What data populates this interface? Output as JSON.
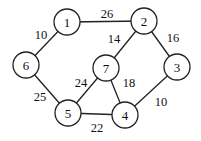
{
  "graph": {
    "type": "weighted-undirected-graph",
    "nodes": [
      {
        "id": "1",
        "label": "1",
        "x": 67,
        "y": 22
      },
      {
        "id": "2",
        "label": "2",
        "x": 144,
        "y": 21
      },
      {
        "id": "3",
        "label": "3",
        "x": 177,
        "y": 67
      },
      {
        "id": "4",
        "label": "4",
        "x": 125,
        "y": 115
      },
      {
        "id": "5",
        "label": "5",
        "x": 68,
        "y": 113
      },
      {
        "id": "6",
        "label": "6",
        "x": 26,
        "y": 65
      },
      {
        "id": "7",
        "label": "7",
        "x": 106,
        "y": 68
      }
    ],
    "edges": [
      {
        "from": "1",
        "to": "2",
        "weight": "26",
        "lx": 107,
        "ly": 14
      },
      {
        "from": "1",
        "to": "6",
        "weight": "10",
        "lx": 41,
        "ly": 35
      },
      {
        "from": "2",
        "to": "7",
        "weight": "14",
        "lx": 114,
        "ly": 39
      },
      {
        "from": "2",
        "to": "3",
        "weight": "16",
        "lx": 173,
        "ly": 38
      },
      {
        "from": "6",
        "to": "5",
        "weight": "25",
        "lx": 40,
        "ly": 97
      },
      {
        "from": "7",
        "to": "5",
        "weight": "24",
        "lx": 81,
        "ly": 83
      },
      {
        "from": "7",
        "to": "4",
        "weight": "18",
        "lx": 129,
        "ly": 83
      },
      {
        "from": "3",
        "to": "4",
        "weight": "10",
        "lx": 161,
        "ly": 102
      },
      {
        "from": "5",
        "to": "4",
        "weight": "22",
        "lx": 97,
        "ly": 128
      }
    ]
  }
}
